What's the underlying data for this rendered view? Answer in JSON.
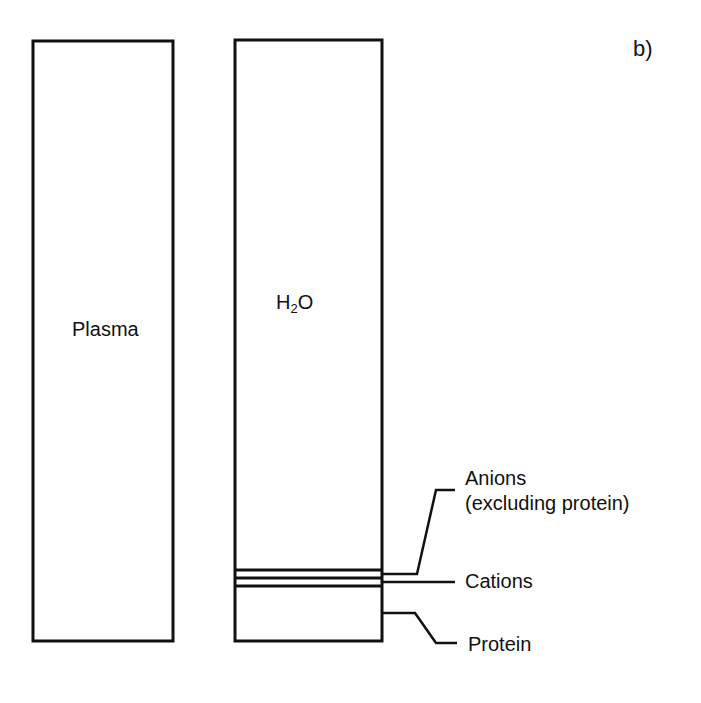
{
  "panel_label": "b)",
  "columns": [
    {
      "id": "plasma",
      "label": "Plasma"
    },
    {
      "id": "water",
      "label_main": "H",
      "label_sub": "2",
      "label_tail": "O"
    }
  ],
  "legend": {
    "anions_line1": "Anions",
    "anions_line2": "(excluding protein)",
    "cations": "Cations",
    "protein": "Protein"
  },
  "colors": {
    "stroke": "#111111",
    "background": "#ffffff"
  }
}
